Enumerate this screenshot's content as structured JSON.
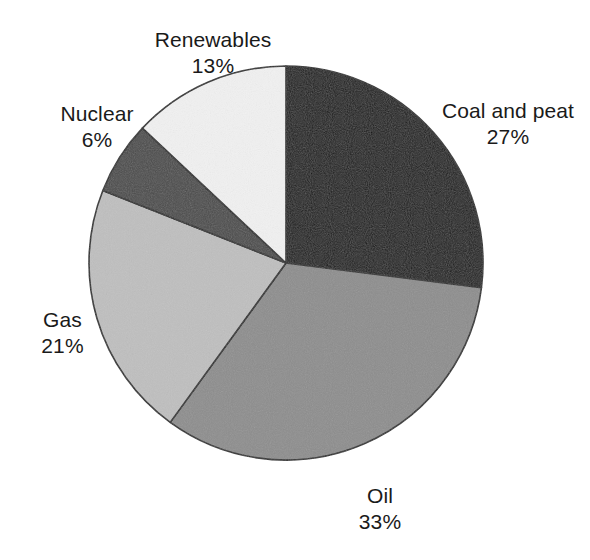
{
  "chart_data": {
    "type": "pie",
    "title": "",
    "subtitle": "",
    "xlabel": "",
    "ylabel": "",
    "legend_position": "none",
    "grid": false,
    "units": "percent",
    "total": 100,
    "start_angle_deg": 0,
    "direction": "clockwise",
    "categories": [
      "Coal and peat",
      "Oil",
      "Gas",
      "Nuclear",
      "Renewables"
    ],
    "values": [
      27,
      33,
      21,
      6,
      13
    ],
    "slices": [
      {
        "label": "Coal and peat",
        "value": 27,
        "value_text": "27%",
        "color": "#1c1c1c",
        "start_deg": 0,
        "end_deg": 97.2
      },
      {
        "label": "Oil",
        "value": 33,
        "value_text": "33%",
        "color": "#8d8d8d",
        "start_deg": 97.2,
        "end_deg": 216.0
      },
      {
        "label": "Gas",
        "value": 21,
        "value_text": "21%",
        "color": "#bfbfbf",
        "start_deg": 216.0,
        "end_deg": 291.6
      },
      {
        "label": "Nuclear",
        "value": 6,
        "value_text": "6%",
        "color": "#4b4b4b",
        "start_deg": 291.6,
        "end_deg": 313.2
      },
      {
        "label": "Renewables",
        "value": 13,
        "value_text": "13%",
        "color": "#f1f1f1",
        "start_deg": 313.2,
        "end_deg": 360.0
      }
    ],
    "outline_color": "#2b2b2b",
    "background_color": "#ffffff"
  },
  "labels": {
    "renewables": {
      "name": "Renewables",
      "value": "13%"
    },
    "coal": {
      "name": "Coal and peat",
      "value": "27%"
    },
    "nuclear": {
      "name": "Nuclear",
      "value": "6%"
    },
    "gas": {
      "name": "Gas",
      "value": "21%"
    },
    "oil": {
      "name": "Oil",
      "value": "33%"
    }
  }
}
